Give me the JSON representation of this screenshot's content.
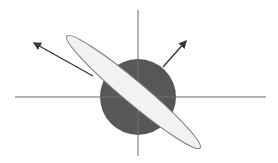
{
  "diagram": {
    "width": 278,
    "height": 163,
    "colors": {
      "background": "#ffffff",
      "axis": "#8a8a8a",
      "circle_fill": "#575757",
      "ellipse_fill": "#f2f2f2",
      "ellipse_stroke": "#7a7a7a",
      "arrow": "#3a3a3a"
    },
    "axes": {
      "horizontal": {
        "x1": 15,
        "y1": 97,
        "x2": 266,
        "y2": 97
      },
      "vertical": {
        "x1": 138,
        "y1": 10,
        "x2": 138,
        "y2": 156
      }
    },
    "circle": {
      "cx": 138,
      "cy": 97,
      "r": 38
    },
    "ellipse": {
      "cx": 133.5,
      "cy": 92,
      "rx": 87,
      "ry": 11,
      "rotation_deg": 40
    },
    "arrows": [
      {
        "name": "arrow-left-up",
        "x1": 93,
        "y1": 76,
        "x2": 34,
        "y2": 43
      },
      {
        "name": "arrow-right-up",
        "x1": 163,
        "y1": 67,
        "x2": 186,
        "y2": 41
      }
    ]
  }
}
